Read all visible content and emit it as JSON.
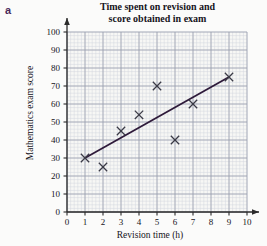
{
  "part_label": "a",
  "chart_data": {
    "type": "scatter",
    "title": "Time spent on revision and score obtained in exam",
    "title_lines": [
      "Time spent on revision and",
      "score obtained in exam"
    ],
    "xlabel": "Revision time (h)",
    "ylabel": "Mathematics exam score",
    "xlim": [
      0,
      10
    ],
    "ylim": [
      0,
      100
    ],
    "xticks": [
      0,
      1,
      2,
      3,
      4,
      5,
      6,
      7,
      8,
      9,
      10
    ],
    "yticks": [
      0,
      10,
      20,
      30,
      40,
      50,
      60,
      70,
      80,
      90,
      100
    ],
    "xtick_labels": [
      "0",
      "1",
      "2",
      "3",
      "4",
      "5",
      "6",
      "7",
      "8",
      "9",
      "10"
    ],
    "ytick_labels": [
      "0",
      "10",
      "20",
      "30",
      "40",
      "50",
      "60",
      "70",
      "80",
      "90",
      "100"
    ],
    "grid": true,
    "grid_minor": true,
    "grid_minor_step_x": 0.2,
    "grid_minor_step_y": 2,
    "legend": null,
    "marker": "x",
    "points": [
      {
        "x": 1,
        "y": 30
      },
      {
        "x": 2,
        "y": 25
      },
      {
        "x": 3,
        "y": 45
      },
      {
        "x": 4,
        "y": 54
      },
      {
        "x": 5,
        "y": 70
      },
      {
        "x": 6,
        "y": 40
      },
      {
        "x": 7,
        "y": 60
      },
      {
        "x": 9,
        "y": 75
      }
    ],
    "series": [
      {
        "name": "Students",
        "type": "scatter",
        "x": [
          1,
          2,
          3,
          4,
          5,
          6,
          7,
          9
        ],
        "y": [
          30,
          25,
          45,
          54,
          70,
          40,
          60,
          75
        ]
      },
      {
        "name": "Line of best fit",
        "type": "line",
        "x": [
          1,
          9
        ],
        "y": [
          30,
          75
        ]
      }
    ],
    "line_of_best_fit": {
      "x1": 1,
      "y1": 30,
      "x2": 9,
      "y2": 75
    }
  },
  "colors": {
    "part_label": "#4a2a5a",
    "line": "#2e1a3a",
    "marker": "#3a3a46",
    "axis": "#2b2b2b",
    "grid_major": "#9aa0ae",
    "grid_minor": "#d2d6de",
    "background": "#fbfbfa",
    "plot_background": "#f7f7f5",
    "text": "#16141a"
  }
}
